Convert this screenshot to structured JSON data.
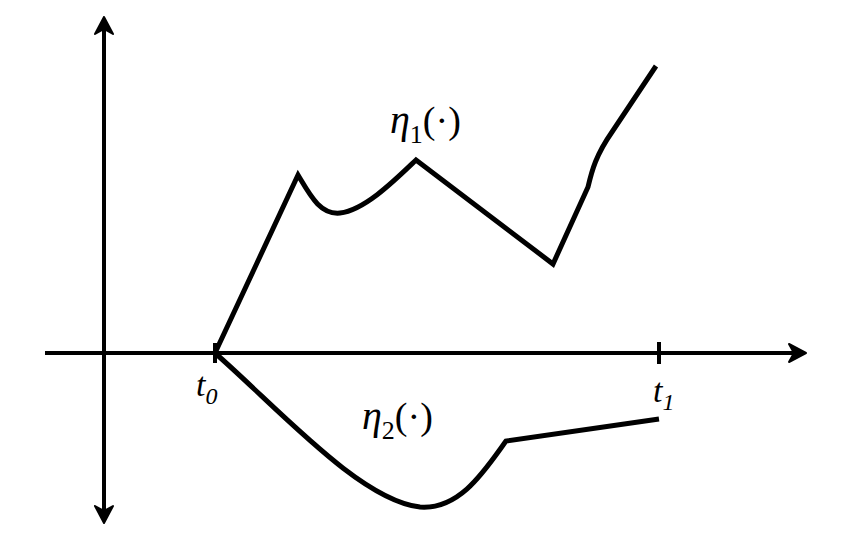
{
  "diagram": {
    "colors": {
      "background": "#ffffff",
      "stroke": "#000000"
    },
    "axes": {
      "vertical": {
        "x": 104,
        "y_top": 18,
        "y_bottom": 522,
        "arrows": [
          "up",
          "down"
        ]
      },
      "horizontal": {
        "y": 353,
        "x_left": 45,
        "x_right": 805,
        "arrows": [
          "right"
        ]
      }
    },
    "ticks": [
      {
        "id": "t0",
        "x": 215,
        "label_main": "t",
        "label_sub": "0"
      },
      {
        "id": "t1",
        "x": 659,
        "label_main": "t",
        "label_sub": "1"
      }
    ],
    "curves": [
      {
        "id": "eta1",
        "label_symbol": "η",
        "label_sub": "1",
        "label_arg": "(·)",
        "path": "M215,353 L298,175 C310,195 320,215 340,213 C365,210 395,180 416,160 L553,264 L588,187 C592,170 596,155 612,132 L656,66"
      },
      {
        "id": "eta2",
        "label_symbol": "η",
        "label_sub": "2",
        "label_arg": "(·)",
        "path": "M215,353 C280,410 360,500 420,507 C460,510 485,470 506,441 L659,419"
      }
    ]
  }
}
